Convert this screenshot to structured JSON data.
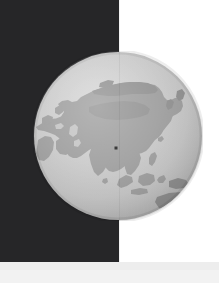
{
  "scene": {
    "title": "Orthographic globe over dark panel",
    "width": 219,
    "height": 283
  },
  "panel": {
    "name": "dark-panel",
    "color": "#262628",
    "x": 0,
    "y": 0,
    "width": 119,
    "height": 262
  },
  "background": {
    "color": "#ffffff"
  },
  "bottom_band": {
    "color": "#ededed",
    "height": 21
  },
  "globe": {
    "projection": "orthographic",
    "center_lon": 90,
    "center_lat": 25,
    "ocean_color": "#c6c6c6",
    "land_color": "#9b9b9b",
    "highland_color": "#8e8e8e",
    "cx": 118,
    "cy": 136,
    "radius": 85,
    "label": "globe"
  },
  "marker": {
    "name": "location-marker",
    "color": "#1b1b1b",
    "x": 116,
    "y": 147,
    "size": 3
  },
  "regions": [
    "Eurasia",
    "Siberia",
    "Arabian Peninsula",
    "India",
    "Southeast Asia",
    "Indonesia",
    "Japan",
    "Australia",
    "Northeast Africa"
  ]
}
